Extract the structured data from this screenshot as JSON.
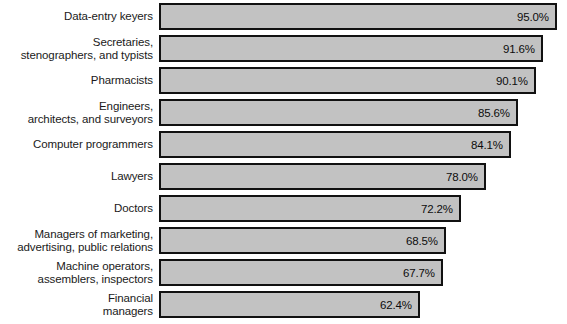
{
  "chart_data": {
    "type": "bar",
    "orientation": "horizontal",
    "title": "",
    "subtitle": "",
    "xlabel": "",
    "ylabel": "",
    "xlim": [
      0,
      95.0
    ],
    "grid": false,
    "legend": null,
    "value_suffix": "%",
    "categories": [
      "Data-entry keyers",
      "Secretaries,\nstenographers, and typists",
      "Pharmacists",
      "Engineers,\narchitects, and surveyors",
      "Computer programmers",
      "Lawyers",
      "Doctors",
      "Managers of marketing,\nadvertising, public relations",
      "Machine operators,\nassemblers, inspectors",
      "Financial\nmanagers"
    ],
    "values": [
      95.0,
      91.6,
      90.1,
      85.6,
      84.1,
      78.0,
      72.2,
      68.5,
      67.7,
      62.4
    ],
    "value_labels": [
      "95.0%",
      "91.6%",
      "90.1%",
      "85.6%",
      "84.1%",
      "78.0%",
      "72.2%",
      "68.5%",
      "67.7%",
      "62.4%"
    ],
    "bar_fill_color": "#c2c2c2",
    "bar_border_color": "#111111",
    "background_color": "#ffffff",
    "text_color": "#1a1a1a"
  },
  "layout": {
    "label_column_width": 153,
    "bar_origin_x": 159,
    "bar_max_width": 398,
    "row_pitch": 32,
    "bar_height": 27,
    "first_row_top": 3
  }
}
